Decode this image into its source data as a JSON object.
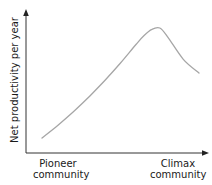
{
  "chart_data": {
    "type": "line",
    "title": "",
    "xlabel": "",
    "ylabel": "Net productivity per year",
    "x_tick_labels": [
      {
        "line1": "Pioneer",
        "line2": "community",
        "position": "start"
      },
      {
        "line1": "Climax",
        "line2": "community",
        "position": "end"
      }
    ],
    "series": [
      {
        "name": "Net productivity",
        "color": "#a6a6a6",
        "x": [
          0.0,
          0.1,
          0.2,
          0.3,
          0.4,
          0.5,
          0.6,
          0.65,
          0.7,
          0.75,
          0.8,
          0.9,
          1.0
        ],
        "values": [
          0.12,
          0.22,
          0.33,
          0.45,
          0.58,
          0.72,
          0.87,
          0.94,
          0.99,
          1.0,
          0.93,
          0.75,
          0.64
        ]
      }
    ],
    "xlim": [
      0,
      1
    ],
    "ylim": [
      0,
      1.1
    ],
    "grid": false,
    "legend": "none",
    "axis_color": "#333333",
    "annotations": []
  },
  "axes": {
    "y_label": "Net productivity per year",
    "x_start_label_line1": "Pioneer",
    "x_start_label_line2": "community",
    "x_end_label_line1": "Climax",
    "x_end_label_line2": "community"
  }
}
